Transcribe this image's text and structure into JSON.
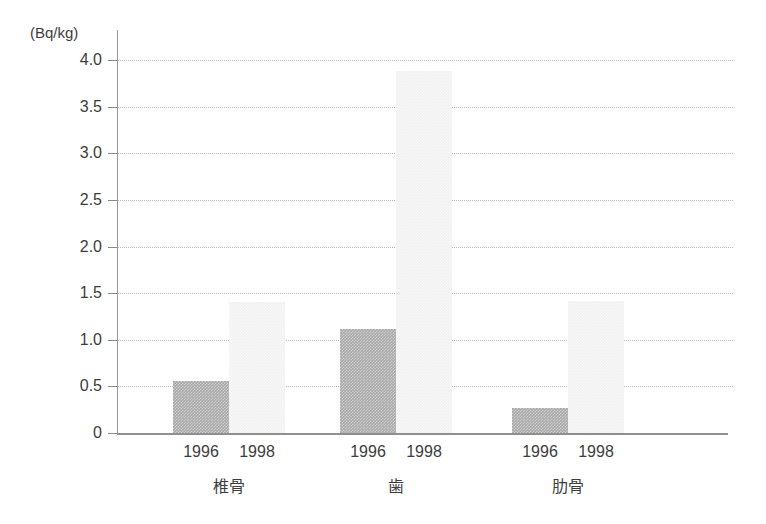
{
  "chart_data": {
    "type": "bar",
    "title": "",
    "subtitle": "",
    "xlabel": "",
    "ylabel": "",
    "unit_label": "(Bq/kg)",
    "ylim": [
      0,
      4.0
    ],
    "yticks": [
      "0",
      "0.5",
      "1.0",
      "1.5",
      "2.0",
      "2.5",
      "3.0",
      "3.5",
      "4.0"
    ],
    "ytick_values": [
      0,
      0.5,
      1.0,
      1.5,
      2.0,
      2.5,
      3.0,
      3.5,
      4.0
    ],
    "grid": true,
    "legend": "none",
    "categories": [
      "椎骨",
      "歯",
      "肋骨"
    ],
    "series": [
      {
        "name": "1996",
        "values": [
          0.56,
          1.12,
          0.27
        ],
        "color": "#a9a9a9"
      },
      {
        "name": "1998",
        "values": [
          1.41,
          3.88,
          1.42
        ],
        "color": "#f1f1f1"
      }
    ],
    "groups": [
      {
        "label": "椎骨",
        "bars": [
          {
            "year": "1996",
            "value": 0.56
          },
          {
            "year": "1998",
            "value": 1.41
          }
        ]
      },
      {
        "label": "歯",
        "bars": [
          {
            "year": "1996",
            "value": 1.12
          },
          {
            "year": "1998",
            "value": 3.88
          }
        ]
      },
      {
        "label": "肋骨",
        "bars": [
          {
            "year": "1996",
            "value": 0.27
          },
          {
            "year": "1998",
            "value": 1.42
          }
        ]
      }
    ]
  }
}
